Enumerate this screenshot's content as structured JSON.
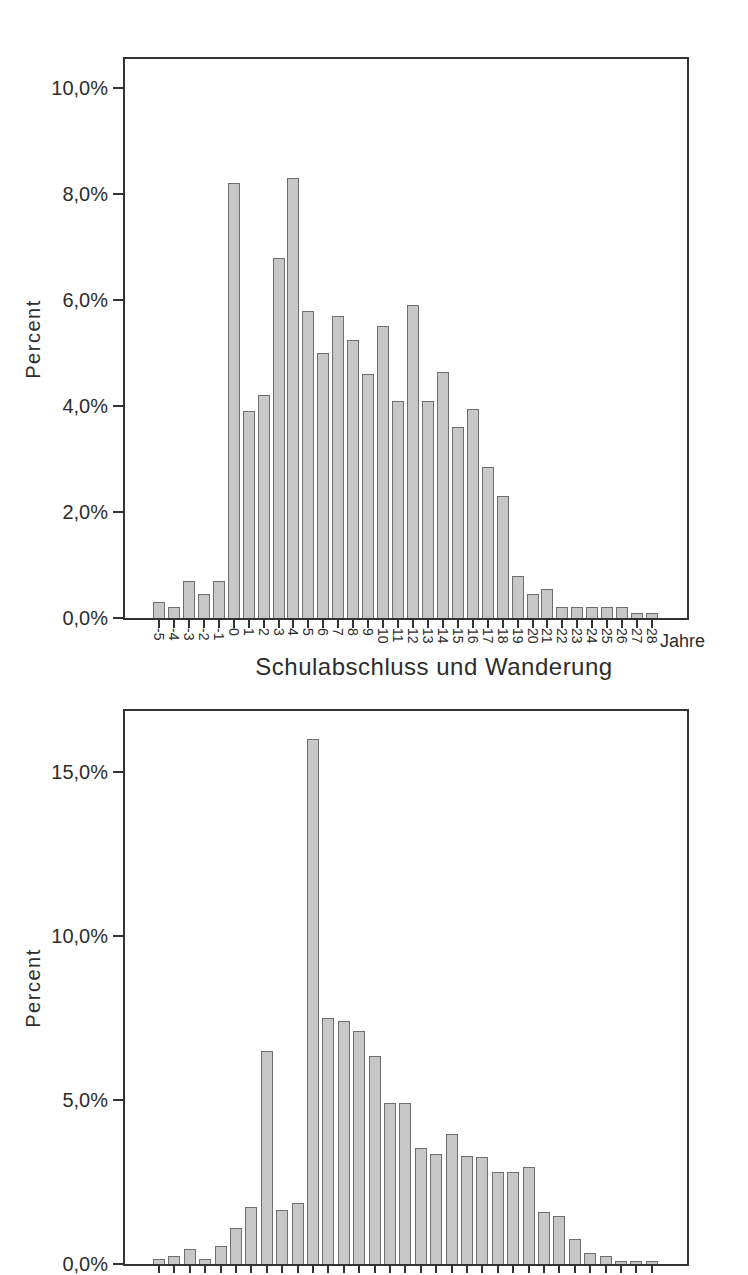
{
  "page": {
    "background_color": "#ffffff"
  },
  "chart_data": [
    {
      "type": "bar",
      "axis_title": "Schulabschluss und Wanderung",
      "ylabel": "Percent",
      "x_unit_label": "Jahre",
      "categories": [
        "-5",
        "-4",
        "-3",
        "-2",
        "-1",
        "0",
        "1",
        "2",
        "3",
        "4",
        "5",
        "6",
        "7",
        "8",
        "9",
        "10",
        "11",
        "12",
        "13",
        "14",
        "15",
        "16",
        "17",
        "18",
        "19",
        "20",
        "21",
        "22",
        "23",
        "24",
        "25",
        "26",
        "27",
        "28"
      ],
      "values": [
        0.3,
        0.2,
        0.7,
        0.45,
        0.7,
        8.2,
        3.9,
        4.2,
        6.8,
        8.3,
        5.8,
        5.0,
        5.7,
        5.25,
        4.6,
        5.5,
        4.1,
        5.9,
        4.1,
        4.65,
        3.6,
        3.95,
        2.85,
        2.3,
        0.8,
        0.45,
        0.55,
        0.2,
        0.2,
        0.2,
        0.2,
        0.2,
        0.1,
        0.1
      ],
      "ytick_values": [
        0,
        2,
        4,
        6,
        8,
        10
      ],
      "ytick_labels": [
        "0,0%",
        "2,0%",
        "4,0%",
        "6,0%",
        "8,0%",
        "10,0%"
      ],
      "ylim": [
        0,
        10.55
      ],
      "grid": false,
      "legend": "none",
      "xtick_labels_visible": true,
      "bar_fill": "#c7c7c7",
      "bar_border": "#6f6f6f",
      "axis_color": "#333333",
      "text_color": "#2d2d2d"
    },
    {
      "type": "bar",
      "ylabel": "Percent",
      "categories": [],
      "values": [
        0.15,
        0.25,
        0.45,
        0.15,
        0.55,
        1.1,
        1.75,
        6.5,
        1.65,
        1.85,
        16.0,
        7.5,
        7.4,
        7.1,
        6.35,
        4.9,
        4.9,
        3.55,
        3.35,
        3.95,
        3.3,
        3.25,
        2.8,
        2.8,
        2.95,
        1.6,
        1.45,
        0.75,
        0.35,
        0.25,
        0.1,
        0.1,
        0.1
      ],
      "ytick_values": [
        0,
        5,
        10,
        15
      ],
      "ytick_labels": [
        "0,0%",
        "5,0%",
        "10,0%",
        "15,0%"
      ],
      "ylim": [
        0,
        16.85
      ],
      "grid": false,
      "legend": "none",
      "xtick_labels_visible": false,
      "bar_fill": "#c7c7c7",
      "bar_border": "#6f6f6f",
      "axis_color": "#333333",
      "text_color": "#2d2d2d"
    }
  ]
}
